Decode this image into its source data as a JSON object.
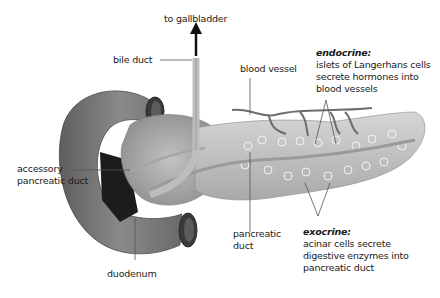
{
  "diagram": {
    "labels": {
      "to_gallbladder": "to gallbladder",
      "bile_duct": "bile duct",
      "blood_vessel": "blood vessel",
      "accessory_pancreatic_duct": [
        "accessory",
        "pancreatic duct"
      ],
      "pancreatic_duct": [
        "pancreatic",
        "duct"
      ],
      "duodenum": "duodenum",
      "endocrine": {
        "title": "endocrine:",
        "lines": [
          "islets of Langerhans cells",
          "secrete hormones into",
          "blood vessels"
        ]
      },
      "exocrine": {
        "title": "exocrine:",
        "lines": [
          "acinar cells secrete",
          "digestive enzymes into",
          "pancreatic duct"
        ]
      }
    },
    "colors": {
      "background": "#ffffff",
      "duodenum": "#7a7a7a",
      "pancreas": "#c8c8c8",
      "duct": "#b0b0b0",
      "leader_line": "#555555",
      "text": "#1a1a1a"
    }
  }
}
